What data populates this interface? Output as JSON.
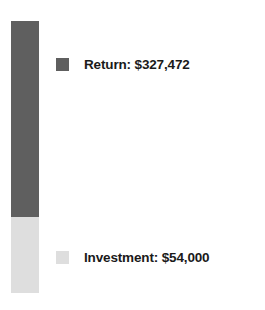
{
  "chart_data": {
    "type": "bar",
    "subtype": "stacked-bar-single-column",
    "title": "",
    "subtitle": "",
    "xlabel": "",
    "ylabel": "",
    "orientation": "vertical",
    "stacked": true,
    "grid": false,
    "axes_visible": false,
    "tick_labels": [],
    "categories": [
      ""
    ],
    "legend_position": "right",
    "background_color": "#FFFFFF",
    "series": [
      {
        "name": "Return",
        "label": "Return: $327,472",
        "value": 327472,
        "value_text": "$327,472",
        "color": "#5F5F5F",
        "segment_height_fraction": 0.721
      },
      {
        "name": "Investment",
        "label": "Investment: $54,000",
        "value": 54000,
        "value_text": "$54,000",
        "color": "#DEDEDE",
        "segment_height_fraction": 0.279
      }
    ],
    "total": 381472,
    "total_text": "$381,472"
  },
  "legend": {
    "entries": [
      {
        "label": "Return: $327,472",
        "swatch_color": "#5F5F5F",
        "swatch_name": "legend-swatch-return"
      },
      {
        "label": "Investment: $54,000",
        "swatch_color": "#DEDEDE",
        "swatch_name": "legend-swatch-investment"
      }
    ]
  }
}
